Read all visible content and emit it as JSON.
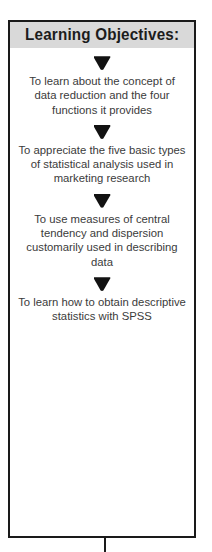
{
  "panel": {
    "title": "Learning Objectives:",
    "header_background": "#d9d9d9",
    "border_color": "#1a1a1a",
    "background": "#ffffff",
    "text_color": "#3b3b3b",
    "marker_icon": "down-triangle-icon",
    "objectives": [
      {
        "text": "To learn about the concept of data reduction and the four functions it provides"
      },
      {
        "text": "To appreciate the five basic types of statistical analysis used in marketing research"
      },
      {
        "text": "To use measures of central tendency and dispersion customarily used in describing data"
      },
      {
        "text": "To learn how to obtain descriptive statistics with SPSS"
      }
    ]
  }
}
